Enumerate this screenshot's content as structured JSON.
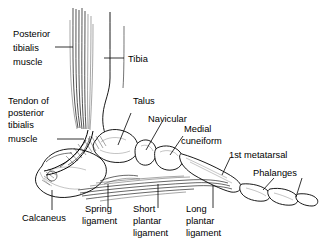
{
  "figure": {
    "background_color": "#ffffff",
    "line_color": "#000000",
    "width": 323,
    "height": 250
  },
  "labels": {
    "posterior_tibialis_muscle": {
      "lines": [
        "Posterior",
        "tibialis",
        "muscle"
      ],
      "line1": "Posterior",
      "line2": "tibialis",
      "line3": "muscle"
    },
    "tendon_of_posterior_tibialis_muscle": {
      "lines": [
        "Tendon of",
        "posterior",
        "tibialis",
        "muscle"
      ],
      "line1": "Tendon of",
      "line2": "posterior",
      "line3": "tibialis",
      "line4": "muscle"
    },
    "tibia": {
      "text": "Tibia"
    },
    "talus": {
      "text": "Talus"
    },
    "navicular": {
      "text": "Navicular"
    },
    "medial_cuneiform": {
      "lines": [
        "Medial",
        "cuneiform"
      ],
      "line1": "Medial",
      "line2": "cuneiform"
    },
    "first_metatarsal": {
      "text": "1st metatarsal"
    },
    "phalanges": {
      "text": "Phalanges"
    },
    "calcaneus": {
      "text": "Calcaneus"
    },
    "spring_ligament": {
      "lines": [
        "Spring",
        "ligament"
      ],
      "line1": "Spring",
      "line2": "ligament"
    },
    "short_plantar_ligament": {
      "lines": [
        "Short",
        "plantar",
        "ligament"
      ],
      "line1": "Short",
      "line2": "plantar",
      "line3": "ligament"
    },
    "long_plantar_ligament": {
      "lines": [
        "Long",
        "plantar",
        "ligament"
      ],
      "line1": "Long",
      "line2": "plantar",
      "line3": "ligament"
    }
  }
}
